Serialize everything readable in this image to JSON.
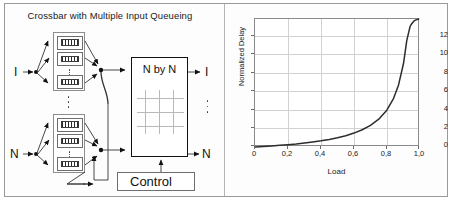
{
  "figure": {
    "panels": [
      "diagram",
      "chart"
    ],
    "border_color": "#9a9a9a",
    "background": "#ffffff"
  },
  "diagram": {
    "title": "Crossbar with Multiple Input Queueing",
    "inputs": [
      {
        "label": "I"
      },
      {
        "label": "N"
      }
    ],
    "outputs": [
      {
        "label": "I"
      },
      {
        "label": "N"
      }
    ],
    "queue_groups": [
      {
        "name": "input-queue-group-top",
        "fifos": [
          "fifo-1",
          "fifo-2",
          "fifo-n"
        ],
        "ellipsis": "vertical-dots"
      },
      {
        "name": "input-queue-group-bottom",
        "fifos": [
          "fifo-1",
          "fifo-2",
          "fifo-n"
        ],
        "ellipsis": "vertical-dots"
      }
    ],
    "group_ellipsis": "vertical-dots",
    "switch": {
      "label": "N by N",
      "grid_rows": 3,
      "grid_cols": 3,
      "grid_color": "#b9b9b9"
    },
    "control": {
      "label": "Control"
    },
    "output_ellipsis": "vertical-dots"
  },
  "chart_data": {
    "type": "line",
    "title": "",
    "xlabel": "Load",
    "ylabel": "Normalized Delay",
    "xlim": [
      0,
      1.0
    ],
    "ylim": [
      0,
      13.8
    ],
    "grid": true,
    "legend": null,
    "xticks": [
      0,
      0.2,
      0.4,
      0.6,
      0.8,
      1.0
    ],
    "xtick_labels": [
      "0",
      "0,2",
      "0,4",
      "0,6",
      "0,8",
      "1,0"
    ],
    "yticks": [
      0,
      2,
      4,
      6,
      8,
      10,
      12
    ],
    "ytick_labels": [
      "0",
      "2",
      "4",
      "6",
      "8",
      "10",
      "12"
    ],
    "line_color": "#2d2d2d",
    "series": [
      {
        "name": "Normalized Delay vs Load",
        "x": [
          0.0,
          0.05,
          0.1,
          0.15,
          0.2,
          0.25,
          0.3,
          0.35,
          0.4,
          0.45,
          0.5,
          0.55,
          0.6,
          0.65,
          0.7,
          0.75,
          0.8,
          0.84,
          0.87,
          0.9,
          0.92,
          0.94,
          0.95,
          0.96,
          0.965,
          0.97,
          0.975,
          0.98,
          0.983,
          0.986,
          0.988,
          0.99,
          0.992
        ],
        "y": [
          0.0,
          0.05,
          0.11,
          0.18,
          0.25,
          0.33,
          0.43,
          0.54,
          0.67,
          0.82,
          1.0,
          1.22,
          1.5,
          1.86,
          2.33,
          3.0,
          4.0,
          5.25,
          6.69,
          9.0,
          11.5,
          13.0,
          13.3,
          13.5,
          13.6,
          13.65,
          13.7,
          13.73,
          13.75,
          13.76,
          13.77,
          13.78,
          13.8
        ]
      }
    ]
  }
}
